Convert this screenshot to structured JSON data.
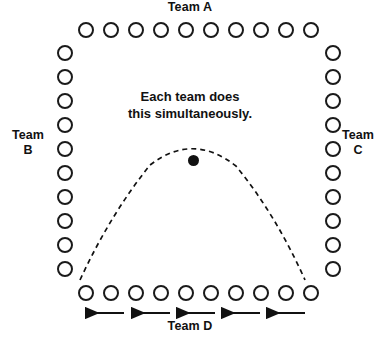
{
  "diagram": {
    "width": 380,
    "height": 342,
    "background_color": "#ffffff",
    "stroke_color": "#1a1a1a",
    "ball_color": "#111111"
  },
  "labels": {
    "team_a": "Team A",
    "team_b": "Team\nB",
    "team_c": "Team\nC",
    "team_d": "Team D",
    "center_note": "Each team does\nthis simultaneously."
  },
  "rows": {
    "top": {
      "name": "Team A",
      "count": 10,
      "orientation": "horizontal",
      "start_x": 78,
      "step_x": 25,
      "y": 22
    },
    "left": {
      "name": "Team B",
      "count": 10,
      "orientation": "vertical",
      "x": 57,
      "start_y": 45,
      "step_y": 24
    },
    "right": {
      "name": "Team C",
      "count": 10,
      "orientation": "vertical",
      "x": 325,
      "start_y": 45,
      "step_y": 24
    },
    "bottom": {
      "name": "Team D",
      "count": 10,
      "orientation": "horizontal",
      "start_x": 78,
      "step_x": 25,
      "y": 285
    }
  },
  "ball": {
    "label": "ball",
    "cx": 193,
    "cy": 160,
    "diameter": 11
  },
  "trajectory": {
    "label": "dashed ball trajectory arc",
    "style": "dashed",
    "dash_pattern": "5 4",
    "path": "M 80 280 Q 110 215 150 165 Q 193 132 236 166 Q 276 215 305 280"
  },
  "arrows": {
    "label": "movement direction arrows",
    "direction": "left",
    "count": 5,
    "y": 313,
    "items": [
      {
        "x_start": 124,
        "x_end": 79
      },
      {
        "x_start": 170,
        "x_end": 125
      },
      {
        "x_start": 215,
        "x_end": 170
      },
      {
        "x_start": 260,
        "x_end": 215
      },
      {
        "x_start": 305,
        "x_end": 260
      }
    ]
  }
}
